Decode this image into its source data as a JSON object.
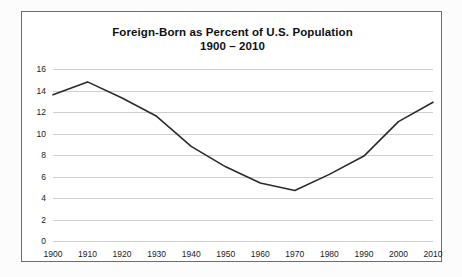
{
  "chart_data": {
    "type": "line",
    "title": "Foreign-Born as Percent of U.S. Population",
    "subtitle": "1900 – 2010",
    "xlabel": "",
    "ylabel": "",
    "x": [
      1900,
      1910,
      1920,
      1930,
      1940,
      1950,
      1960,
      1970,
      1980,
      1990,
      2000,
      2010
    ],
    "categories": [
      "1900",
      "1910",
      "1920",
      "1930",
      "1940",
      "1950",
      "1960",
      "1970",
      "1980",
      "1990",
      "2000",
      "2010"
    ],
    "values": [
      13.6,
      14.8,
      13.3,
      11.6,
      8.8,
      6.9,
      5.4,
      4.7,
      6.2,
      7.9,
      11.1,
      12.9
    ],
    "series": [
      {
        "name": "Foreign-Born Percent",
        "values": [
          13.6,
          14.8,
          13.3,
          11.6,
          8.8,
          6.9,
          5.4,
          4.7,
          6.2,
          7.9,
          11.1,
          12.9
        ]
      }
    ],
    "ylim": [
      0,
      16
    ],
    "xlim": [
      1900,
      2010
    ],
    "yticks": [
      0,
      2,
      4,
      6,
      8,
      10,
      12,
      14,
      16
    ],
    "ytick_labels": [
      "0",
      "2",
      "4",
      "6",
      "8",
      "10",
      "12",
      "14",
      "16"
    ],
    "xticks": [
      1900,
      1910,
      1920,
      1930,
      1940,
      1950,
      1960,
      1970,
      1980,
      1990,
      2000,
      2010
    ],
    "xtick_labels": [
      "1900",
      "1910",
      "1920",
      "1930",
      "1940",
      "1950",
      "1960",
      "1970",
      "1980",
      "1990",
      "2000",
      "2010"
    ],
    "grid": "horizontal",
    "legend": "none",
    "line_color": "#2b2b2b",
    "grid_color": "#cfcfcf",
    "frame_color": "#6d6d6d",
    "background_color": "#ffffff"
  }
}
